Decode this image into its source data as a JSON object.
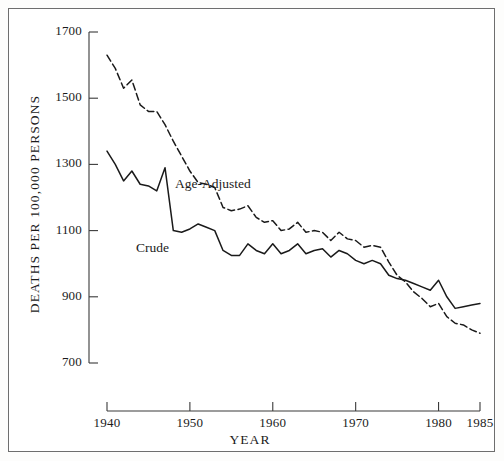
{
  "chart_data": {
    "type": "line",
    "title": "",
    "xlabel": "YEAR",
    "ylabel": "DEATHS PER 100,000 PERSONS",
    "xlim": [
      1940,
      1985
    ],
    "ylim": [
      700,
      1700
    ],
    "grid": false,
    "legend_position": "inline-annotation",
    "xticks": [
      1940,
      1950,
      1960,
      1970,
      1980,
      1985
    ],
    "xtick_labels": [
      "1940",
      "1950",
      "1960",
      "1970",
      "1980",
      "1985"
    ],
    "yticks": [
      700,
      900,
      1100,
      1300,
      1500,
      1700
    ],
    "ytick_labels": [
      "700",
      "900",
      "1100",
      "1300",
      "1500",
      "1700"
    ],
    "annotations": [
      {
        "text": "Age-Adjusted",
        "x": 1955.5,
        "y": 1255
      },
      {
        "text": "Crude",
        "x": 1949.5,
        "y": 1060
      }
    ],
    "series": [
      {
        "name": "Age-Adjusted",
        "style": "dashed",
        "color": "#1a1a1a",
        "x": [
          1940,
          1941,
          1942,
          1943,
          1944,
          1945,
          1946,
          1947,
          1948,
          1949,
          1950,
          1951,
          1952,
          1953,
          1954,
          1955,
          1956,
          1957,
          1958,
          1959,
          1960,
          1961,
          1962,
          1963,
          1964,
          1965,
          1966,
          1967,
          1968,
          1969,
          1970,
          1971,
          1972,
          1973,
          1974,
          1975,
          1976,
          1977,
          1978,
          1979,
          1980,
          1981,
          1982,
          1983,
          1984,
          1985
        ],
        "values": [
          1630,
          1590,
          1530,
          1555,
          1480,
          1460,
          1460,
          1420,
          1370,
          1325,
          1280,
          1245,
          1240,
          1230,
          1170,
          1160,
          1165,
          1175,
          1140,
          1125,
          1130,
          1100,
          1105,
          1125,
          1095,
          1100,
          1095,
          1070,
          1095,
          1075,
          1070,
          1050,
          1055,
          1050,
          1005,
          965,
          945,
          915,
          895,
          870,
          880,
          840,
          820,
          815,
          800,
          790
        ]
      },
      {
        "name": "Crude",
        "style": "solid",
        "color": "#1a1a1a",
        "x": [
          1940,
          1941,
          1942,
          1943,
          1944,
          1945,
          1946,
          1947,
          1948,
          1949,
          1950,
          1951,
          1952,
          1953,
          1954,
          1955,
          1956,
          1957,
          1958,
          1959,
          1960,
          1961,
          1962,
          1963,
          1964,
          1965,
          1966,
          1967,
          1968,
          1969,
          1970,
          1971,
          1972,
          1973,
          1974,
          1975,
          1976,
          1977,
          1978,
          1979,
          1980,
          1981,
          1982,
          1983,
          1984,
          1985
        ],
        "values": [
          1340,
          1300,
          1250,
          1280,
          1240,
          1235,
          1220,
          1290,
          1100,
          1095,
          1105,
          1120,
          1110,
          1100,
          1040,
          1025,
          1025,
          1060,
          1040,
          1030,
          1060,
          1030,
          1040,
          1060,
          1030,
          1040,
          1045,
          1020,
          1040,
          1030,
          1010,
          1000,
          1010,
          1000,
          965,
          955,
          950,
          940,
          930,
          920,
          950,
          900,
          865,
          870,
          875,
          880
        ]
      }
    ]
  },
  "axis": {
    "y_title": "DEATHS PER 100,000 PERSONS",
    "x_title": "YEAR"
  },
  "labels": {
    "age_adjusted": "Age-Adjusted",
    "crude": "Crude"
  }
}
